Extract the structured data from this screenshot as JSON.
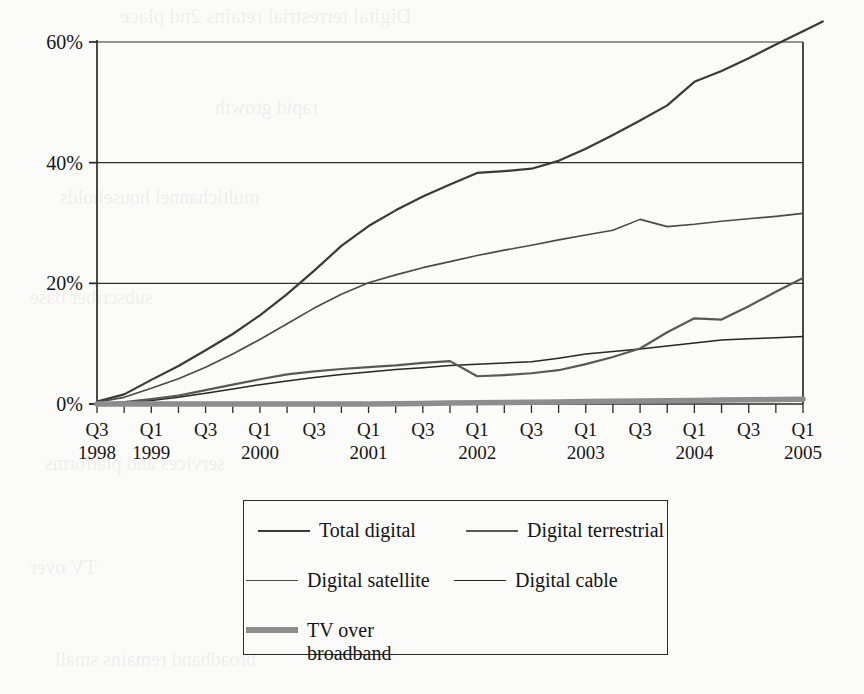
{
  "chart_data": {
    "type": "line",
    "title": "",
    "xlabel": "",
    "ylabel": "",
    "ylim": [
      0,
      60
    ],
    "y_ticks": [
      "0%",
      "20%",
      "40%",
      "60%"
    ],
    "y_tick_values": [
      0,
      20,
      40,
      60
    ],
    "grid": "horizontal gridlines at 20%, 40%, 60%",
    "legend_position": "below plot, bordered box, two columns",
    "x_tick_count": 27,
    "x_labels": [
      {
        "q": "Q3",
        "year": "1998",
        "index": 0
      },
      {
        "q": "Q1",
        "year": "1999",
        "index": 2
      },
      {
        "q": "Q3",
        "year": "",
        "index": 4
      },
      {
        "q": "Q1",
        "year": "2000",
        "index": 6
      },
      {
        "q": "Q3",
        "year": "",
        "index": 8
      },
      {
        "q": "Q1",
        "year": "2001",
        "index": 10
      },
      {
        "q": "Q3",
        "year": "",
        "index": 12
      },
      {
        "q": "Q1",
        "year": "2002",
        "index": 14
      },
      {
        "q": "Q3",
        "year": "",
        "index": 16
      },
      {
        "q": "Q1",
        "year": "2003",
        "index": 18
      },
      {
        "q": "Q3",
        "year": "",
        "index": 20
      },
      {
        "q": "Q1",
        "year": "2004",
        "index": 22
      },
      {
        "q": "Q3",
        "year": "",
        "index": 24
      },
      {
        "q": "Q1",
        "year": "2005",
        "index": 26
      }
    ],
    "x": [
      "Q3 1998",
      "Q4 1998",
      "Q1 1999",
      "Q2 1999",
      "Q3 1999",
      "Q4 1999",
      "Q1 2000",
      "Q2 2000",
      "Q3 2000",
      "Q4 2000",
      "Q1 2001",
      "Q2 2001",
      "Q3 2001",
      "Q4 2001",
      "Q1 2002",
      "Q2 2002",
      "Q3 2002",
      "Q4 2002",
      "Q1 2003",
      "Q2 2003",
      "Q3 2003",
      "Q4 2003",
      "Q1 2004",
      "Q2 2004",
      "Q3 2004",
      "Q4 2004",
      "Q1 2005"
    ],
    "series": [
      {
        "name": "Total digital",
        "color": "#3a3a3a",
        "width": 2.2,
        "values": [
          0.4,
          1.6,
          4.0,
          6.3,
          8.9,
          11.6,
          14.7,
          18.2,
          22.1,
          26.2,
          29.5,
          32.1,
          34.4,
          36.4,
          38.3,
          38.6,
          39.0,
          40.3,
          42.3,
          44.6,
          47.0,
          49.5,
          53.4,
          55.2,
          57.3,
          59.6,
          61.8
        ]
      },
      {
        "name": "Digital satellite",
        "color": "#4a4a4a",
        "width": 1.6,
        "values": [
          0.3,
          1.1,
          2.6,
          4.2,
          6.1,
          8.3,
          10.7,
          13.3,
          15.9,
          18.2,
          20.1,
          21.4,
          22.6,
          23.6,
          24.6,
          25.5,
          26.3,
          27.2,
          28.0,
          28.8,
          30.6,
          29.4,
          29.8,
          30.3,
          30.7,
          31.1,
          31.6
        ]
      },
      {
        "name": "Digital cable",
        "color": "#262626",
        "width": 1.5,
        "values": [
          0.0,
          0.2,
          0.6,
          1.1,
          1.8,
          2.5,
          3.2,
          3.8,
          4.4,
          4.9,
          5.3,
          5.7,
          6.0,
          6.4,
          6.6,
          6.8,
          7.0,
          7.6,
          8.3,
          8.7,
          9.1,
          9.6,
          10.1,
          10.6,
          10.8,
          11.0,
          11.2
        ]
      },
      {
        "name": "Digital terrestrial",
        "color": "#585858",
        "width": 2.2,
        "values": [
          0.0,
          0.3,
          0.8,
          1.4,
          2.3,
          3.2,
          4.1,
          4.9,
          5.4,
          5.8,
          6.1,
          6.4,
          6.8,
          7.1,
          4.6,
          4.8,
          5.1,
          5.6,
          6.6,
          7.8,
          9.2,
          11.9,
          14.2,
          14.0,
          16.2,
          18.6,
          20.9
        ]
      },
      {
        "name": "TV over broadband",
        "color": "#8d8d8d",
        "width": 5.5,
        "values": [
          0.0,
          0.0,
          0.0,
          0.0,
          0.0,
          0.0,
          0.0,
          0.0,
          0.0,
          0.0,
          0.0,
          0.05,
          0.1,
          0.15,
          0.2,
          0.25,
          0.3,
          0.35,
          0.4,
          0.45,
          0.5,
          0.55,
          0.6,
          0.65,
          0.7,
          0.75,
          0.8
        ]
      }
    ]
  },
  "legend": {
    "items": [
      {
        "label": "Total digital",
        "swatch": "s-total"
      },
      {
        "label": "Digital terrestrial",
        "swatch": "s-terr"
      },
      {
        "label": "Digital satellite",
        "swatch": "s-sat"
      },
      {
        "label": "Digital cable",
        "swatch": "s-cable"
      },
      {
        "label": "TV over\nbroadband",
        "swatch": "s-bb"
      }
    ]
  },
  "axes": {
    "y_labels": [
      "60%",
      "40%",
      "20%",
      "0%"
    ]
  },
  "bleed_text": {
    "lines": [
      "Digital terrestrial retains 2nd place",
      "rapid growth",
      "multichannel households",
      "subscriber base",
      "services and platforms",
      "TV over",
      "broadband remains small"
    ]
  }
}
